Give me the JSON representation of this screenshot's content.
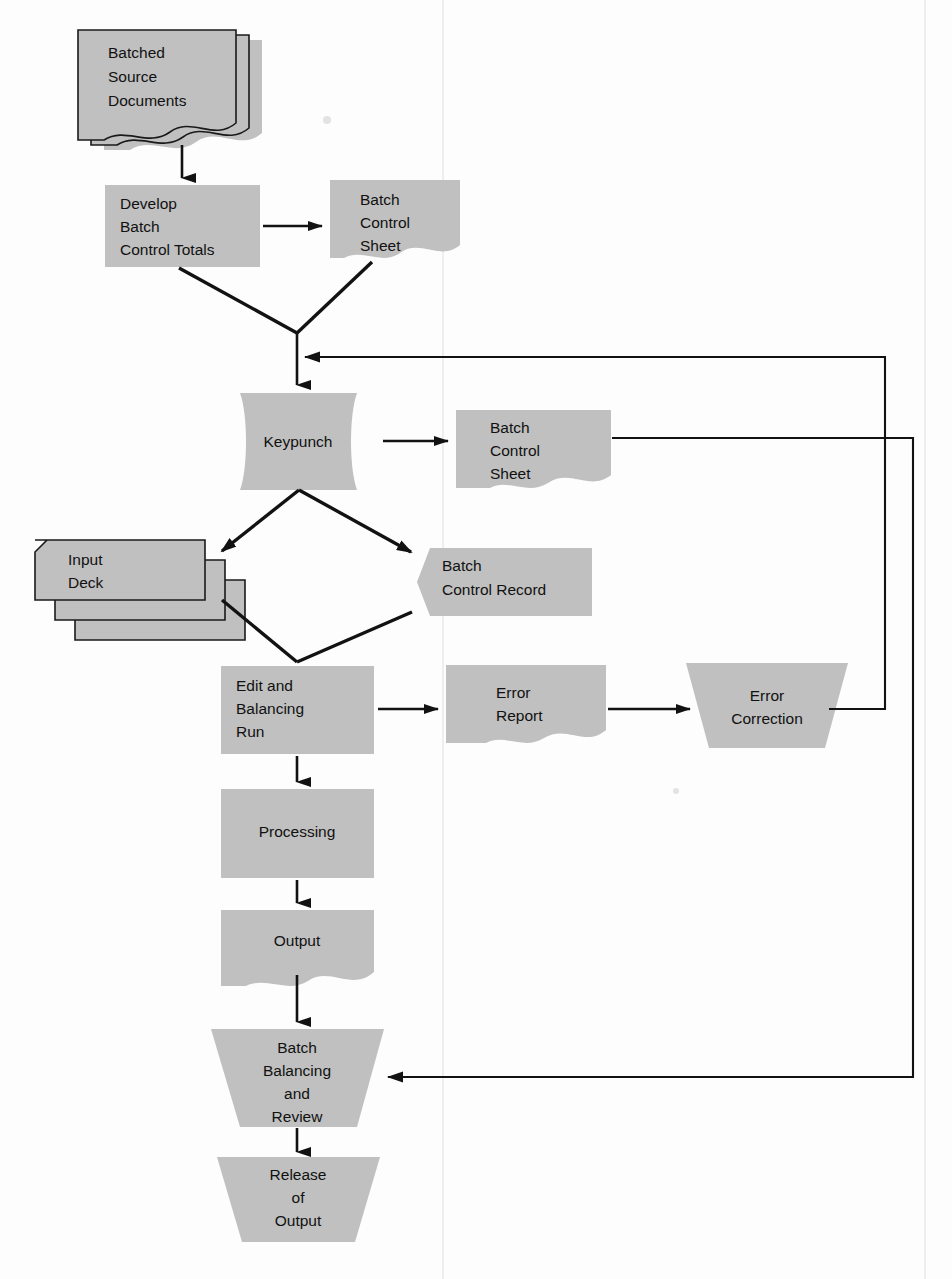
{
  "diagram": {
    "type": "flowchart",
    "colors": {
      "shape_fill": "#c0c0c0",
      "line": "#121212",
      "text": "#111111",
      "background": "#fdfdfd"
    },
    "nodes": [
      {
        "id": "batched-source-documents",
        "label": "Batched\nSource\nDocuments",
        "line1": "Batched",
        "line2": "Source",
        "line3": "Documents",
        "shape": "stacked-document",
        "x": 78,
        "y": 30,
        "w": 178,
        "h": 120
      },
      {
        "id": "develop-batch-control-totals",
        "label": "Develop\nBatch\nControl Totals",
        "line1": "Develop",
        "line2": "Batch",
        "line3": "Control Totals",
        "shape": "process-rectangle",
        "x": 105,
        "y": 185,
        "w": 155,
        "h": 82
      },
      {
        "id": "batch-control-sheet-1",
        "label": "Batch\nControl\nSheet",
        "line1": "Batch",
        "line2": "Control",
        "line3": "Sheet",
        "shape": "document",
        "x": 330,
        "y": 180,
        "w": 130,
        "h": 90
      },
      {
        "id": "keypunch",
        "label": "Keypunch",
        "line1": "Keypunch",
        "shape": "manual-operation-rounded",
        "x": 222,
        "y": 393,
        "w": 153,
        "h": 97
      },
      {
        "id": "batch-control-sheet-2",
        "label": "Batch\nControl\nSheet",
        "line1": "Batch",
        "line2": "Control",
        "line3": "Sheet",
        "shape": "document",
        "x": 456,
        "y": 410,
        "w": 155,
        "h": 90
      },
      {
        "id": "input-deck",
        "label": "Input\nDeck",
        "line1": "Input",
        "line2": "Deck",
        "shape": "stacked-punched-card",
        "x": 35,
        "y": 540,
        "w": 190,
        "h": 100
      },
      {
        "id": "batch-control-record",
        "label": "Batch\nControl Record",
        "line1": "Batch",
        "line2": "Control Record",
        "shape": "magnetic-record",
        "x": 417,
        "y": 548,
        "w": 155,
        "h": 68
      },
      {
        "id": "edit-and-balancing-run",
        "label": "Edit and\nBalancing\nRun",
        "line1": "Edit and",
        "line2": "Balancing",
        "line3": "Run",
        "shape": "process-rectangle",
        "x": 221,
        "y": 666,
        "w": 153,
        "h": 88
      },
      {
        "id": "error-report",
        "label": "Error\nReport",
        "line1": "Error",
        "line2": "Report",
        "shape": "document",
        "x": 446,
        "y": 665,
        "w": 160,
        "h": 88
      },
      {
        "id": "error-correction",
        "label": "Error\nCorrection",
        "line1": "Error",
        "line2": "Correction",
        "shape": "manual-operation-trapezoid",
        "x": 686,
        "y": 663,
        "w": 162,
        "h": 85
      },
      {
        "id": "processing",
        "label": "Processing",
        "line1": "Processing",
        "shape": "process-rectangle",
        "x": 221,
        "y": 789,
        "w": 153,
        "h": 89
      },
      {
        "id": "output",
        "label": "Output",
        "line1": "Output",
        "shape": "document",
        "x": 221,
        "y": 910,
        "w": 153,
        "h": 88
      },
      {
        "id": "batch-balancing-and-review",
        "label": "Batch\nBalancing\nand\nReview",
        "line1": "Batch",
        "line2": "Balancing",
        "line3": "and",
        "line4": "Review",
        "shape": "trapezoid",
        "x": 211,
        "y": 1029,
        "w": 173,
        "h": 98
      },
      {
        "id": "release-of-output",
        "label": "Release\nof\nOutput",
        "line1": "Release",
        "line2": "of",
        "line3": "Output",
        "shape": "trapezoid",
        "x": 217,
        "y": 1157,
        "w": 163,
        "h": 85
      }
    ],
    "connectors": [
      {
        "id": "docs-to-develop",
        "from": "batched-source-documents",
        "to": "develop-batch-control-totals",
        "style": "straight-down-arrow"
      },
      {
        "id": "develop-to-sheet1",
        "from": "develop-batch-control-totals",
        "to": "batch-control-sheet-1",
        "style": "straight-right-arrow"
      },
      {
        "id": "develop-to-junction",
        "from": "develop-batch-control-totals",
        "to": "keypunch-junction",
        "style": "diagonal"
      },
      {
        "id": "sheet1-to-junction",
        "from": "batch-control-sheet-1",
        "to": "keypunch-junction",
        "style": "diagonal"
      },
      {
        "id": "junction-to-keypunch",
        "from": "keypunch-junction",
        "to": "keypunch",
        "style": "straight-down-arrow"
      },
      {
        "id": "keypunch-to-sheet2",
        "from": "keypunch",
        "to": "batch-control-sheet-2",
        "style": "straight-right-arrow"
      },
      {
        "id": "keypunch-to-input-deck",
        "from": "keypunch",
        "to": "input-deck",
        "style": "diagonal-arrow"
      },
      {
        "id": "keypunch-to-batch-control-record",
        "from": "keypunch",
        "to": "batch-control-record",
        "style": "diagonal-arrow"
      },
      {
        "id": "input-deck-to-edit",
        "from": "input-deck",
        "to": "edit-and-balancing-run",
        "style": "diagonal"
      },
      {
        "id": "batch-control-record-to-edit",
        "from": "batch-control-record",
        "to": "edit-and-balancing-run",
        "style": "diagonal"
      },
      {
        "id": "edit-to-error-report",
        "from": "edit-and-balancing-run",
        "to": "error-report",
        "style": "straight-right-arrow"
      },
      {
        "id": "error-report-to-error-correction",
        "from": "error-report",
        "to": "error-correction",
        "style": "straight-right-arrow"
      },
      {
        "id": "error-correction-feedback-to-keypunch",
        "from": "error-correction",
        "to": "keypunch-junction",
        "style": "orthogonal-feedback-arrow"
      },
      {
        "id": "sheet2-feedback-to-batch-balancing",
        "from": "batch-control-sheet-2",
        "to": "batch-balancing-and-review",
        "style": "orthogonal-feedback-arrow"
      },
      {
        "id": "edit-to-processing",
        "from": "edit-and-balancing-run",
        "to": "processing",
        "style": "straight-down-arrow"
      },
      {
        "id": "processing-to-output",
        "from": "processing",
        "to": "output",
        "style": "straight-down-arrow"
      },
      {
        "id": "output-to-batch-balancing",
        "from": "output",
        "to": "batch-balancing-and-review",
        "style": "straight-down-arrow"
      },
      {
        "id": "batch-balancing-to-release",
        "from": "batch-balancing-and-review",
        "to": "release-of-output",
        "style": "straight-down-arrow"
      }
    ]
  }
}
